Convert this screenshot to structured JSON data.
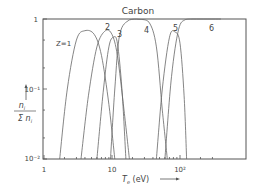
{
  "chart_data": {
    "type": "line",
    "title": "Carbon",
    "xlabel": "T_e (eV)",
    "ylabel": "n_i / Σ n_i",
    "xscale": "log",
    "yscale": "log",
    "xlim": [
      1,
      400
    ],
    "ylim": [
      0.01,
      1
    ],
    "x_ticks": [
      {
        "value": 1,
        "label": "1"
      },
      {
        "value": 10,
        "label": "10"
      },
      {
        "value": 100,
        "label": "10²"
      }
    ],
    "y_ticks": [
      {
        "value": 1,
        "label": "1"
      },
      {
        "value": 0.1,
        "label": "10⁻¹"
      },
      {
        "value": 0.01,
        "label": "10⁻²"
      }
    ],
    "grid": false,
    "legend": "inline curve labels",
    "series": [
      {
        "name": "Z=1",
        "label": "Z=1",
        "x": [
          1.7,
          2.2,
          3.0,
          4.0,
          5.5,
          7.0,
          9.0,
          11.0
        ],
        "y": [
          0.01,
          0.1,
          0.5,
          0.68,
          0.6,
          0.3,
          0.06,
          0.01
        ]
      },
      {
        "name": "Z=2",
        "label": "2",
        "x": [
          3.5,
          4.5,
          6.0,
          8.0,
          10.0,
          12.0,
          15.0,
          18.0
        ],
        "y": [
          0.01,
          0.08,
          0.4,
          0.68,
          0.6,
          0.3,
          0.05,
          0.01
        ]
      },
      {
        "name": "Z=3",
        "label": "3",
        "x": [
          6.0,
          7.5,
          9.0,
          10.5,
          12.0,
          14.0,
          16.0
        ],
        "y": [
          0.01,
          0.1,
          0.4,
          0.55,
          0.45,
          0.1,
          0.01
        ]
      },
      {
        "name": "Z=4",
        "label": "4",
        "x": [
          9.5,
          11.0,
          13.0,
          18.0,
          25.0,
          35.0,
          45.0,
          55.0,
          65.0
        ],
        "y": [
          0.01,
          0.1,
          0.6,
          0.97,
          0.99,
          0.9,
          0.4,
          0.05,
          0.01
        ]
      },
      {
        "name": "Z=5",
        "label": "5",
        "x": [
          45.0,
          55.0,
          70.0,
          85.0,
          100.0,
          115.0,
          125.0
        ],
        "y": [
          0.01,
          0.1,
          0.55,
          0.65,
          0.45,
          0.08,
          0.01
        ]
      },
      {
        "name": "Z=6",
        "label": "6",
        "x": [
          60.0,
          75.0,
          95.0,
          120.0,
          160.0,
          400.0
        ],
        "y": [
          0.01,
          0.15,
          0.7,
          0.98,
          1.0,
          1.0
        ]
      }
    ]
  }
}
